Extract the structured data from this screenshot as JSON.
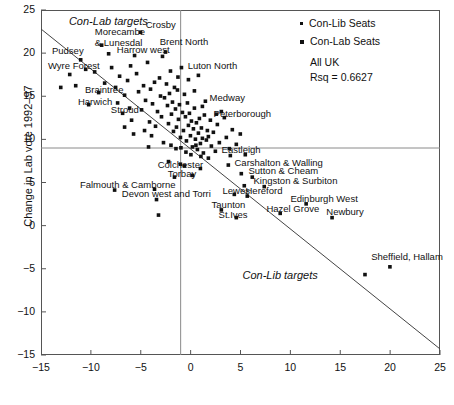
{
  "chart_data": {
    "type": "scatter",
    "title": "",
    "xlabel": "",
    "ylabel": "Change in Lab vote 1992–97",
    "xlim": [
      -15,
      25
    ],
    "ylim": [
      -15,
      25
    ],
    "xticks": [
      -15,
      -10,
      -5,
      0,
      5,
      10,
      15,
      20,
      25
    ],
    "xtick_labels": [
      "−15",
      "−10",
      "−5",
      "0",
      "5",
      "10",
      "15",
      "20",
      "25"
    ],
    "yticks": [
      -15,
      -10,
      -5,
      0,
      5,
      10,
      15,
      20,
      25
    ],
    "ytick_labels": [
      "−15",
      "−10",
      "−5",
      "0",
      "5",
      "10",
      "15",
      "20",
      "25"
    ],
    "grid": false,
    "reference_lines": [
      {
        "orient": "vertical",
        "value": -1
      },
      {
        "orient": "horizontal",
        "value": 9
      }
    ],
    "fit_line": {
      "x0": -15,
      "y0": 22.8,
      "x1": 25,
      "y1": -14.3
    },
    "legend": {
      "position": "top-right",
      "entries": [
        {
          "label": "Con-Lib Seats",
          "marker": "small-square",
          "color": "#111111"
        },
        {
          "label": "Con-Lab Seats",
          "marker": "square",
          "color": "#111111"
        }
      ],
      "notes": [
        "All UK",
        "Rsq = 0.6627"
      ]
    },
    "annotations": [
      {
        "text": "Con-Lab targets",
        "x": -12.2,
        "y": 23.6,
        "style": "italic"
      },
      {
        "text": "Con-Lib targets",
        "x": 5.2,
        "y": -5.8,
        "style": "italic"
      }
    ],
    "labeled_points": [
      {
        "label": "Crosby",
        "x": -5.0,
        "y": 22.4,
        "lx": -4.5,
        "ly": 23.1
      },
      {
        "label": "Morecambe\n& Lunesdal",
        "x": -8.9,
        "y": 20.9,
        "lx": -9.6,
        "ly": 22.3
      },
      {
        "label": "Brent North",
        "x": -2.5,
        "y": 20.1,
        "lx": -3.1,
        "ly": 21.2
      },
      {
        "label": "Harrow west",
        "x": -5.6,
        "y": 19.7,
        "lx": -7.4,
        "ly": 20.2
      },
      {
        "label": "Pudsey",
        "x": -11.0,
        "y": 19.2,
        "lx": -13.9,
        "ly": 20.1
      },
      {
        "label": "Wyre Forest",
        "x": -12.1,
        "y": 17.5,
        "lx": -14.3,
        "ly": 18.4
      },
      {
        "label": "Luton North",
        "x": -0.9,
        "y": 18.3,
        "lx": -0.3,
        "ly": 18.4
      },
      {
        "label": "Braintree",
        "x": -9.2,
        "y": 15.4,
        "lx": -10.6,
        "ly": 15.6
      },
      {
        "label": "Harwich",
        "x": -10.2,
        "y": 14.0,
        "lx": -11.3,
        "ly": 14.2
      },
      {
        "label": "Medway",
        "x": 1.5,
        "y": 14.4,
        "lx": 1.9,
        "ly": 14.7
      },
      {
        "label": "Stroud",
        "x": -6.8,
        "y": 13.0,
        "lx": -8.0,
        "ly": 13.3
      },
      {
        "label": "Peterborough",
        "x": 3.4,
        "y": 12.5,
        "lx": 2.3,
        "ly": 12.8
      },
      {
        "label": "Eastleigh",
        "x": 4.0,
        "y": 8.1,
        "lx": 3.1,
        "ly": 8.6
      },
      {
        "label": "Carshalton & Walling",
        "x": 3.8,
        "y": 7.0,
        "lx": 4.4,
        "ly": 7.2
      },
      {
        "label": "Colchester",
        "x": -0.6,
        "y": 6.9,
        "lx": -3.3,
        "ly": 6.9
      },
      {
        "label": "Sutton & Cheam",
        "x": 5.1,
        "y": 6.0,
        "lx": 5.8,
        "ly": 6.2
      },
      {
        "label": "Torbay",
        "x": 0.2,
        "y": 5.8,
        "lx": -2.3,
        "ly": 5.9
      },
      {
        "label": "Kingston & Surbiton",
        "x": 7.4,
        "y": 4.5,
        "lx": 6.3,
        "ly": 5.1
      },
      {
        "label": "Falmouth & Camborne",
        "x": -7.6,
        "y": 4.1,
        "lx": -11.1,
        "ly": 4.6
      },
      {
        "label": "Hereford",
        "x": 5.7,
        "y": 3.4,
        "lx": 5.5,
        "ly": 3.9
      },
      {
        "label": "Lewes",
        "x": 4.4,
        "y": 3.6,
        "lx": 3.2,
        "ly": 3.9
      },
      {
        "label": "Devon west and Torri",
        "x": -3.4,
        "y": 3.0,
        "lx": -6.9,
        "ly": 3.5
      },
      {
        "label": "Edinburgh West",
        "x": 11.6,
        "y": 2.5,
        "lx": 10.0,
        "ly": 3.0
      },
      {
        "label": "Taunton",
        "x": 3.1,
        "y": 1.8,
        "lx": 2.1,
        "ly": 2.3
      },
      {
        "label": "Hazel Grove",
        "x": 9.0,
        "y": 1.4,
        "lx": 7.6,
        "ly": 1.8
      },
      {
        "label": "Newbury",
        "x": 14.2,
        "y": 0.9,
        "lx": 13.6,
        "ly": 1.5
      },
      {
        "label": "St.Ives",
        "x": 4.6,
        "y": 0.9,
        "lx": 2.8,
        "ly": 1.1
      },
      {
        "label": "Sheffield, Hallam",
        "x": 20.0,
        "y": -4.8,
        "lx": 18.1,
        "ly": -3.8
      }
    ],
    "points": [
      [
        -12.1,
        17.5
      ],
      [
        -11.0,
        19.2
      ],
      [
        -9.6,
        17.8
      ],
      [
        -8.9,
        20.9
      ],
      [
        -9.2,
        15.4
      ],
      [
        -10.2,
        14.0
      ],
      [
        -8.2,
        19.9
      ],
      [
        -7.9,
        18.3
      ],
      [
        -7.5,
        16.0
      ],
      [
        -7.1,
        17.3
      ],
      [
        -6.8,
        13.0
      ],
      [
        -6.6,
        15.1
      ],
      [
        -6.3,
        16.8
      ],
      [
        -6.1,
        13.6
      ],
      [
        -5.9,
        12.2
      ],
      [
        -5.6,
        19.7
      ],
      [
        -5.4,
        17.6
      ],
      [
        -5.2,
        15.5
      ],
      [
        -5.0,
        22.4
      ],
      [
        -4.9,
        13.4
      ],
      [
        -4.7,
        16.2
      ],
      [
        -4.5,
        14.5
      ],
      [
        -4.3,
        18.9
      ],
      [
        -4.1,
        12.0
      ],
      [
        -4.0,
        15.8
      ],
      [
        -3.8,
        14.1
      ],
      [
        -3.6,
        16.6
      ],
      [
        -3.5,
        11.5
      ],
      [
        -3.3,
        13.2
      ],
      [
        -3.1,
        17.1
      ],
      [
        -3.0,
        15.0
      ],
      [
        -2.9,
        12.6
      ],
      [
        -2.8,
        19.6
      ],
      [
        -2.6,
        14.8
      ],
      [
        -2.5,
        20.1
      ],
      [
        -2.4,
        16.4
      ],
      [
        -2.3,
        13.9
      ],
      [
        -2.2,
        11.8
      ],
      [
        -2.1,
        15.3
      ],
      [
        -2.0,
        17.9
      ],
      [
        -1.9,
        12.9
      ],
      [
        -1.8,
        14.3
      ],
      [
        -1.7,
        10.9
      ],
      [
        -1.6,
        16.0
      ],
      [
        -1.5,
        13.5
      ],
      [
        -1.4,
        11.4
      ],
      [
        -1.3,
        15.7
      ],
      [
        -1.2,
        12.3
      ],
      [
        -1.1,
        14.0
      ],
      [
        -1.0,
        10.2
      ],
      [
        -0.9,
        18.3
      ],
      [
        -0.8,
        13.1
      ],
      [
        -0.7,
        11.0
      ],
      [
        -0.6,
        15.2
      ],
      [
        -0.5,
        12.6
      ],
      [
        -0.4,
        9.8
      ],
      [
        -0.3,
        14.2
      ],
      [
        -0.2,
        11.6
      ],
      [
        -0.1,
        13.0
      ],
      [
        0.0,
        10.4
      ],
      [
        0.1,
        12.1
      ],
      [
        0.2,
        9.1
      ],
      [
        0.3,
        11.2
      ],
      [
        0.4,
        13.6
      ],
      [
        0.5,
        10.0
      ],
      [
        0.6,
        11.9
      ],
      [
        0.7,
        8.8
      ],
      [
        0.8,
        10.7
      ],
      [
        0.9,
        12.4
      ],
      [
        1.0,
        9.5
      ],
      [
        1.1,
        11.3
      ],
      [
        1.2,
        10.1
      ],
      [
        1.3,
        8.4
      ],
      [
        1.4,
        12.8
      ],
      [
        1.5,
        14.4
      ],
      [
        1.6,
        9.9
      ],
      [
        1.7,
        11.0
      ],
      [
        1.8,
        10.3
      ],
      [
        2.0,
        12.2
      ],
      [
        2.1,
        9.2
      ],
      [
        2.3,
        10.8
      ],
      [
        2.5,
        8.6
      ],
      [
        2.7,
        11.7
      ],
      [
        2.9,
        9.6
      ],
      [
        3.1,
        13.2
      ],
      [
        3.4,
        12.5
      ],
      [
        3.6,
        10.2
      ],
      [
        3.9,
        8.9
      ],
      [
        4.2,
        11.1
      ],
      [
        4.6,
        9.4
      ],
      [
        5.0,
        10.6
      ],
      [
        5.5,
        8.2
      ],
      [
        -11.5,
        16.2
      ],
      [
        -10.5,
        18.1
      ],
      [
        -8.6,
        16.5
      ],
      [
        -7.3,
        14.2
      ],
      [
        -6.0,
        18.5
      ],
      [
        -4.6,
        11.0
      ],
      [
        -3.9,
        10.4
      ],
      [
        -2.7,
        9.6
      ],
      [
        -1.95,
        9.3
      ],
      [
        -1.45,
        8.9
      ],
      [
        -0.95,
        9.0
      ],
      [
        -0.45,
        8.5
      ],
      [
        0.05,
        8.2
      ],
      [
        0.55,
        9.3
      ],
      [
        1.05,
        8.0
      ],
      [
        -2.2,
        7.4
      ],
      [
        -1.0,
        7.1
      ],
      [
        -0.6,
        6.9
      ],
      [
        0.2,
        5.8
      ],
      [
        -1.6,
        5.6
      ],
      [
        1.0,
        6.6
      ],
      [
        1.8,
        7.8
      ],
      [
        -3.6,
        4.2
      ],
      [
        -7.6,
        4.1
      ],
      [
        -3.4,
        3.0
      ],
      [
        -3.2,
        1.2
      ],
      [
        3.1,
        1.8
      ],
      [
        4.4,
        3.6
      ],
      [
        4.6,
        0.9
      ],
      [
        5.7,
        3.4
      ],
      [
        5.4,
        4.6
      ],
      [
        4.0,
        8.1
      ],
      [
        3.8,
        7.0
      ],
      [
        5.1,
        6.0
      ],
      [
        7.4,
        4.5
      ],
      [
        6.2,
        5.6
      ],
      [
        9.0,
        1.4
      ],
      [
        11.6,
        2.5
      ],
      [
        14.2,
        0.9
      ],
      [
        20.0,
        -4.8
      ],
      [
        17.5,
        -5.7
      ],
      [
        -6.6,
        11.4
      ],
      [
        -5.7,
        10.6
      ],
      [
        -4.2,
        9.1
      ],
      [
        -0.2,
        16.9
      ],
      [
        0.4,
        15.6
      ],
      [
        1.2,
        13.8
      ],
      [
        2.6,
        12.9
      ],
      [
        0.8,
        17.4
      ],
      [
        -1.25,
        17.2
      ],
      [
        -13.0,
        16.0
      ]
    ]
  },
  "caption": ""
}
